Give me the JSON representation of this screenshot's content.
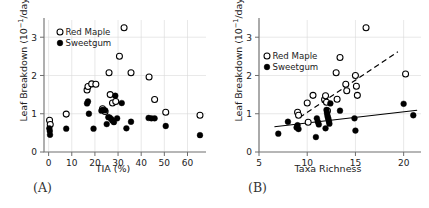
{
  "figure": {
    "panel_a_tag": "(A)",
    "panel_b_tag": "(B)"
  },
  "legend": {
    "red_maple": "Red Maple",
    "sweetgum": "Sweetgum",
    "red_maple_marker": "open-circle",
    "sweetgum_marker": "filled-circle"
  },
  "axis_text": {
    "ylabel_prefix": "Leaf Breakdown (10",
    "ylabel_exponent": "−1",
    "ylabel_suffix": "/day)",
    "ylabel_full": "Leaf Breakdown (10−1/day)",
    "xlabel_a": "TIA (%)",
    "xlabel_b": "Taxa Richness"
  },
  "colors": {
    "background": "#ffffff",
    "marker_line": "#000000",
    "marker_open_fill": "#ffffff",
    "grid": "#d8d8d8",
    "axis": "#6e6e6e",
    "text": "#222222"
  },
  "chart_data": [
    {
      "type": "scatter",
      "panel": "A",
      "title": "",
      "xlabel": "TIA (%)",
      "ylabel": "Leaf Breakdown (10−1/day)",
      "xlim": [
        -2,
        68
      ],
      "ylim": [
        0,
        3.45
      ],
      "xticks": [
        0,
        10,
        20,
        30,
        40,
        50,
        60
      ],
      "yticks": [
        0,
        1,
        2,
        3
      ],
      "grid": true,
      "legend_position": "top-left",
      "series": [
        {
          "name": "Red Maple",
          "marker": "open-circle",
          "points": [
            [
              0.4,
              0.83
            ],
            [
              0.7,
              0.72
            ],
            [
              7.6,
              0.99
            ],
            [
              16.6,
              1.62
            ],
            [
              17.0,
              1.71
            ],
            [
              18.6,
              1.78
            ],
            [
              20.4,
              1.77
            ],
            [
              23.3,
              1.13
            ],
            [
              24.4,
              1.06
            ],
            [
              26.1,
              2.07
            ],
            [
              26.6,
              1.5
            ],
            [
              27.6,
              1.28
            ],
            [
              29.0,
              1.32
            ],
            [
              30.6,
              2.5
            ],
            [
              32.6,
              3.25
            ],
            [
              35.6,
              2.07
            ],
            [
              43.4,
              1.96
            ],
            [
              45.8,
              1.37
            ],
            [
              50.6,
              1.04
            ],
            [
              65.4,
              0.96
            ]
          ]
        },
        {
          "name": "Sweetgum",
          "marker": "filled-circle",
          "points": [
            [
              0.3,
              0.62
            ],
            [
              0.5,
              0.55
            ],
            [
              0.6,
              0.45
            ],
            [
              7.6,
              0.61
            ],
            [
              16.6,
              1.27
            ],
            [
              17.0,
              1.32
            ],
            [
              17.4,
              1.0
            ],
            [
              19.4,
              0.61
            ],
            [
              22.8,
              1.08
            ],
            [
              23.4,
              1.1
            ],
            [
              24.4,
              1.09
            ],
            [
              25.1,
              0.73
            ],
            [
              25.8,
              0.91
            ],
            [
              26.4,
              0.9
            ],
            [
              27.1,
              0.86
            ],
            [
              27.6,
              0.82
            ],
            [
              28.2,
              0.78
            ],
            [
              28.8,
              1.47
            ],
            [
              29.6,
              0.88
            ],
            [
              31.6,
              1.28
            ],
            [
              33.6,
              0.62
            ],
            [
              35.6,
              0.79
            ],
            [
              43.2,
              0.89
            ],
            [
              44.4,
              0.88
            ],
            [
              45.8,
              0.88
            ],
            [
              50.6,
              0.68
            ],
            [
              65.4,
              0.44
            ]
          ]
        }
      ]
    },
    {
      "type": "scatter",
      "panel": "B",
      "title": "",
      "xlabel": "Taxa Richness",
      "ylabel": "Leaf Breakdown (10−1/day)",
      "xlim": [
        5,
        21.8
      ],
      "ylim": [
        0,
        3.45
      ],
      "xticks": [
        5,
        10,
        15,
        20
      ],
      "yticks": [
        0,
        1,
        2,
        3
      ],
      "grid": true,
      "legend_position": "upper-left",
      "series": [
        {
          "name": "Red Maple",
          "marker": "open-circle",
          "points": [
            [
              9.0,
              1.04
            ],
            [
              9.1,
              0.96
            ],
            [
              10.0,
              1.28
            ],
            [
              10.1,
              0.78
            ],
            [
              10.6,
              1.48
            ],
            [
              11.8,
              1.37
            ],
            [
              11.9,
              1.47
            ],
            [
              12.0,
              1.3
            ],
            [
              12.1,
              1.08
            ],
            [
              13.0,
              2.07
            ],
            [
              13.1,
              1.38
            ],
            [
              13.4,
              2.47
            ],
            [
              14.0,
              1.77
            ],
            [
              14.1,
              1.6
            ],
            [
              15.0,
              2.0
            ],
            [
              15.1,
              1.72
            ],
            [
              15.2,
              1.48
            ],
            [
              16.1,
              3.25
            ],
            [
              20.2,
              2.04
            ]
          ]
        },
        {
          "name": "Sweetgum",
          "marker": "filled-circle",
          "points": [
            [
              7.0,
              0.48
            ],
            [
              8.0,
              0.79
            ],
            [
              8.9,
              0.64
            ],
            [
              9.0,
              0.7
            ],
            [
              9.1,
              0.6
            ],
            [
              10.9,
              0.39
            ],
            [
              11.0,
              0.88
            ],
            [
              11.1,
              0.79
            ],
            [
              11.2,
              0.72
            ],
            [
              11.9,
              0.62
            ],
            [
              12.0,
              1.1
            ],
            [
              12.05,
              1.02
            ],
            [
              12.1,
              0.95
            ],
            [
              12.15,
              0.9
            ],
            [
              12.2,
              0.86
            ],
            [
              12.25,
              0.8
            ],
            [
              12.3,
              0.74
            ],
            [
              12.4,
              1.27
            ],
            [
              13.4,
              1.08
            ],
            [
              14.9,
              0.88
            ],
            [
              15.0,
              0.56
            ],
            [
              20.0,
              1.26
            ],
            [
              21.0,
              0.96
            ]
          ]
        }
      ],
      "fits": [
        {
          "name": "Red Maple fit",
          "style": "dashed",
          "x": [
            9.2,
            19.4
          ],
          "y": [
            0.9,
            2.62
          ]
        },
        {
          "name": "Sweetgum fit",
          "style": "solid",
          "x": [
            6.6,
            21.4
          ],
          "y": [
            0.66,
            1.09
          ]
        }
      ]
    }
  ]
}
